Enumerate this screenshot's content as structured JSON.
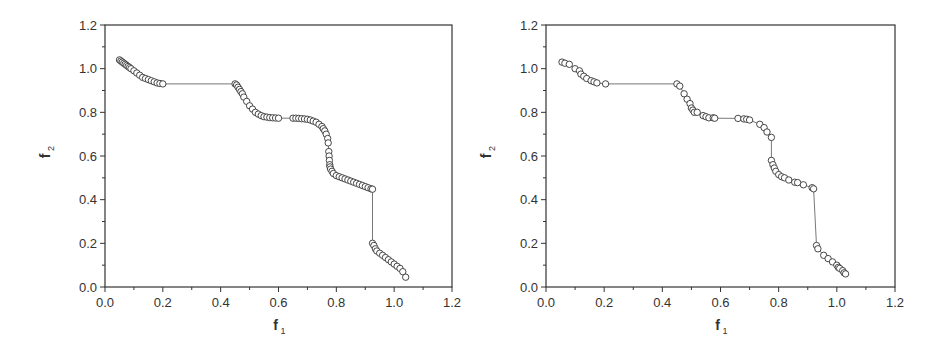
{
  "chart_data": [
    {
      "type": "line",
      "title": "",
      "xlabel": "f1",
      "ylabel": "f2",
      "xlim": [
        0.0,
        1.2
      ],
      "ylim": [
        0.0,
        1.2
      ],
      "xticks": [
        "0.0",
        "0.2",
        "0.4",
        "0.6",
        "0.8",
        "1.0",
        "1.2"
      ],
      "yticks": [
        "0.0",
        "0.2",
        "0.4",
        "0.6",
        "0.8",
        "1.0",
        "1.2"
      ],
      "grid": false,
      "legend": null,
      "marker": "open-circle",
      "series": [
        {
          "name": "Pareto front (dense)",
          "x": [
            0.05,
            0.055,
            0.06,
            0.065,
            0.07,
            0.075,
            0.08,
            0.085,
            0.09,
            0.1,
            0.11,
            0.12,
            0.13,
            0.14,
            0.15,
            0.16,
            0.17,
            0.18,
            0.19,
            0.2,
            0.45,
            0.455,
            0.46,
            0.465,
            0.47,
            0.475,
            0.48,
            0.49,
            0.5,
            0.51,
            0.52,
            0.53,
            0.54,
            0.55,
            0.56,
            0.57,
            0.58,
            0.59,
            0.6,
            0.65,
            0.66,
            0.67,
            0.68,
            0.69,
            0.7,
            0.71,
            0.72,
            0.73,
            0.74,
            0.75,
            0.755,
            0.76,
            0.765,
            0.77,
            0.772,
            0.774,
            0.775,
            0.776,
            0.777,
            0.778,
            0.78,
            0.785,
            0.79,
            0.8,
            0.81,
            0.82,
            0.83,
            0.84,
            0.85,
            0.86,
            0.87,
            0.88,
            0.89,
            0.9,
            0.91,
            0.92,
            0.925,
            0.925,
            0.93,
            0.935,
            0.94,
            0.95,
            0.96,
            0.97,
            0.98,
            0.99,
            1.0,
            1.01,
            1.02,
            1.03,
            1.04
          ],
          "y": [
            1.04,
            1.035,
            1.03,
            1.025,
            1.02,
            1.015,
            1.01,
            1.005,
            1.0,
            0.99,
            0.98,
            0.97,
            0.96,
            0.955,
            0.95,
            0.945,
            0.94,
            0.935,
            0.932,
            0.93,
            0.93,
            0.925,
            0.915,
            0.905,
            0.895,
            0.885,
            0.87,
            0.85,
            0.83,
            0.815,
            0.8,
            0.792,
            0.785,
            0.78,
            0.778,
            0.776,
            0.775,
            0.774,
            0.773,
            0.773,
            0.773,
            0.772,
            0.771,
            0.77,
            0.768,
            0.765,
            0.76,
            0.755,
            0.745,
            0.735,
            0.725,
            0.715,
            0.7,
            0.68,
            0.66,
            0.62,
            0.6,
            0.58,
            0.56,
            0.55,
            0.54,
            0.53,
            0.52,
            0.51,
            0.505,
            0.5,
            0.495,
            0.49,
            0.485,
            0.48,
            0.475,
            0.47,
            0.465,
            0.46,
            0.455,
            0.45,
            0.448,
            0.2,
            0.19,
            0.175,
            0.165,
            0.155,
            0.145,
            0.135,
            0.125,
            0.115,
            0.105,
            0.095,
            0.085,
            0.07,
            0.045
          ]
        }
      ]
    },
    {
      "type": "line",
      "title": "",
      "xlabel": "f1",
      "ylabel": "f2",
      "xlim": [
        0.0,
        1.2
      ],
      "ylim": [
        0.0,
        1.2
      ],
      "xticks": [
        "0.0",
        "0.2",
        "0.4",
        "0.6",
        "0.8",
        "1.0",
        "1.2"
      ],
      "yticks": [
        "0.0",
        "0.2",
        "0.4",
        "0.6",
        "0.8",
        "1.0",
        "1.2"
      ],
      "grid": false,
      "legend": null,
      "marker": "open-circle",
      "series": [
        {
          "name": "Pareto front (sparse)",
          "x": [
            0.055,
            0.065,
            0.08,
            0.1,
            0.115,
            0.12,
            0.13,
            0.14,
            0.155,
            0.165,
            0.175,
            0.205,
            0.45,
            0.46,
            0.475,
            0.485,
            0.495,
            0.5,
            0.505,
            0.51,
            0.52,
            0.54,
            0.55,
            0.56,
            0.575,
            0.58,
            0.66,
            0.68,
            0.69,
            0.7,
            0.735,
            0.75,
            0.76,
            0.775,
            0.775,
            0.78,
            0.785,
            0.79,
            0.8,
            0.81,
            0.82,
            0.835,
            0.855,
            0.865,
            0.885,
            0.915,
            0.92,
            0.93,
            0.935,
            0.955,
            0.97,
            0.985,
            1.0,
            1.005,
            1.01,
            1.02,
            1.025,
            1.03
          ],
          "y": [
            1.03,
            1.025,
            1.02,
            1.0,
            0.99,
            0.975,
            0.965,
            0.955,
            0.945,
            0.94,
            0.935,
            0.93,
            0.93,
            0.92,
            0.885,
            0.86,
            0.84,
            0.82,
            0.81,
            0.8,
            0.8,
            0.785,
            0.78,
            0.775,
            0.775,
            0.773,
            0.772,
            0.77,
            0.768,
            0.765,
            0.745,
            0.73,
            0.71,
            0.685,
            0.58,
            0.56,
            0.545,
            0.53,
            0.515,
            0.505,
            0.5,
            0.49,
            0.48,
            0.478,
            0.468,
            0.455,
            0.45,
            0.19,
            0.175,
            0.145,
            0.13,
            0.115,
            0.1,
            0.09,
            0.085,
            0.075,
            0.065,
            0.06
          ]
        }
      ]
    }
  ],
  "panels": [
    {
      "xlabel": "f",
      "xlabel_sub": "1",
      "ylabel": "f",
      "ylabel_sub": "2"
    },
    {
      "xlabel": "f",
      "xlabel_sub": "1",
      "ylabel": "f",
      "ylabel_sub": "2"
    }
  ],
  "colors": {
    "axis": "#333333",
    "line": "#555555",
    "marker_stroke": "#333333",
    "marker_fill": "#ffffff"
  }
}
